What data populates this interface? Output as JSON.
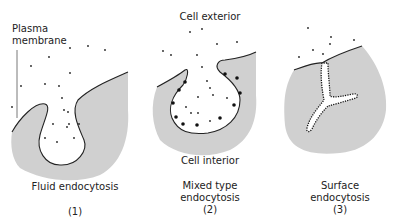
{
  "labels": {
    "plasma_membrane": "Plasma membrane",
    "plasma_line1": "Plasma",
    "plasma_line2": "membrane",
    "cell_exterior": "Cell exterior",
    "cell_interior": "Cell interior"
  },
  "panels": [
    {
      "title": "Fluid endocytosis",
      "title_line1": "Fluid endocytosis",
      "title_line2": "",
      "number": "(1)"
    },
    {
      "title": "Mixed type endocytosis",
      "title_line1": "Mixed type",
      "title_line2": "endocytosis",
      "number": "(2)"
    },
    {
      "title": "Surface endocytosis",
      "title_line1": "Surface",
      "title_line2": "endocytosis",
      "number": "(3)"
    }
  ],
  "colors": {
    "cytoplasm": "#d0d0d0",
    "membrane": "#222222",
    "background": "#ffffff"
  }
}
